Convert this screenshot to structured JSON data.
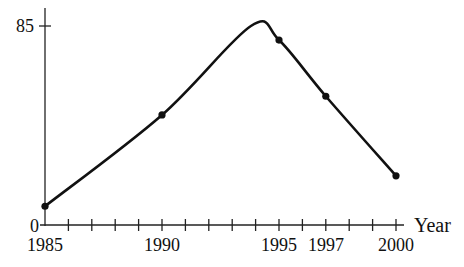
{
  "chart_data": {
    "type": "line",
    "title": "",
    "xlabel": "Year",
    "ylabel": "",
    "xlim": [
      1985,
      2000
    ],
    "ylim": [
      0,
      85
    ],
    "grid": false,
    "legend": null,
    "x_tick_labels": [
      "1985",
      "1990",
      "1995",
      "1997",
      "2000"
    ],
    "x_minor_ticks_every": 1,
    "y_tick_labels": [
      "0",
      "85"
    ],
    "smooth": true,
    "series": [
      {
        "name": "curve",
        "points": [
          {
            "x": 1985,
            "y": 8
          },
          {
            "x": 1990,
            "y": 47
          },
          {
            "x": 1995,
            "y": 79
          },
          {
            "x": 1997,
            "y": 55
          },
          {
            "x": 2000,
            "y": 21
          }
        ],
        "peak": {
          "x": 1993.8,
          "y": 85
        }
      }
    ]
  }
}
